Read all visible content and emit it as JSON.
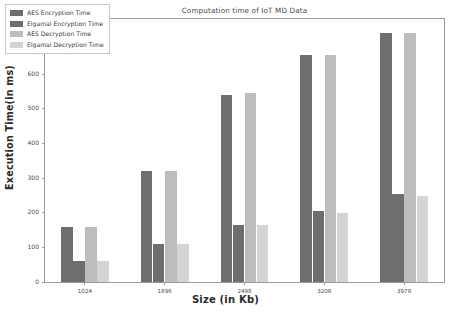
{
  "chart_data": {
    "type": "bar",
    "title": "Computation time of IoT MD Data",
    "xlabel": "Size (in Kb)",
    "ylabel": "Execution Time(in ms)",
    "categories": [
      "1024",
      "1896",
      "2498",
      "3208",
      "3978"
    ],
    "series": [
      {
        "name": "AES Encryption Time",
        "color": "#6e6e6e",
        "values": [
          160,
          320,
          540,
          655,
          720
        ]
      },
      {
        "name": "Elgamal Encryption Time",
        "color": "#6e6e6e",
        "values": [
          60,
          110,
          165,
          205,
          255
        ]
      },
      {
        "name": "AES Decryption Time",
        "color": "#bdbdbd",
        "values": [
          160,
          320,
          545,
          655,
          720
        ]
      },
      {
        "name": "Elgamal Decryption Time",
        "color": "#d4d4d4",
        "values": [
          60,
          110,
          165,
          200,
          250
        ]
      }
    ],
    "ylim": [
      0,
      760
    ],
    "yticks": [
      "0",
      "100",
      "200",
      "300",
      "400",
      "500",
      "600",
      "700"
    ],
    "ytick_values": [
      0,
      100,
      200,
      300,
      400,
      500,
      600,
      700
    ],
    "grid": false,
    "legend_position": "upper left"
  }
}
